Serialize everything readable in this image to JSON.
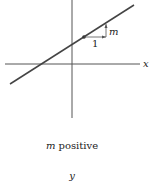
{
  "diagram": {
    "axis_x_label": "x",
    "axis_y_label": "y",
    "run_label": "1",
    "rise_label": "m",
    "caption_var": "m",
    "caption_rest": " positive",
    "colors": {
      "axis": "#555555",
      "line": "#444444",
      "text": "#222222"
    }
  }
}
